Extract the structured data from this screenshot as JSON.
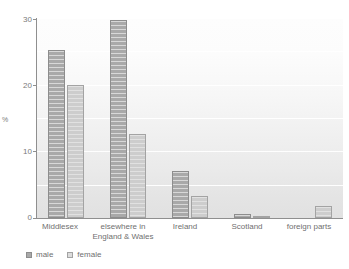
{
  "chart_data": {
    "type": "bar",
    "title": "",
    "subtitle": "",
    "xlabel": "",
    "ylabel": "%",
    "ylim": [
      0,
      30
    ],
    "yticks": [
      0,
      10,
      20,
      30
    ],
    "ytick_labels": [
      "0",
      "10",
      "20",
      "30"
    ],
    "gridlines": [
      0,
      5,
      10,
      15,
      20,
      25,
      30
    ],
    "grid": true,
    "legend_position": "bottom-left",
    "categories": [
      "Middlesex",
      "elsewhere in\nEngland & Wales",
      "Ireland",
      "Scotland",
      "foreign parts"
    ],
    "category_labels": [
      {
        "line1": "Middlesex",
        "line2": ""
      },
      {
        "line1": "elsewhere in",
        "line2": "England & Wales"
      },
      {
        "line1": "Ireland",
        "line2": ""
      },
      {
        "line1": "Scotland",
        "line2": ""
      },
      {
        "line1": "foreign parts",
        "line2": ""
      }
    ],
    "series": [
      {
        "name": "male",
        "color": "#a9a9a9",
        "values": [
          25.2,
          29.7,
          7.1,
          0.6,
          0
        ]
      },
      {
        "name": "female",
        "color": "#cdcdcd",
        "values": [
          19.9,
          12.6,
          3.3,
          0.2,
          1.8
        ]
      }
    ]
  },
  "legend": {
    "entries": [
      {
        "label": "male",
        "swatch": "male-swatch-icon"
      },
      {
        "label": "female",
        "swatch": "female-swatch-icon"
      }
    ]
  },
  "axes": {
    "y_title": "%",
    "y_tick_0": "0",
    "y_tick_1": "10",
    "y_tick_2": "20",
    "y_tick_3": "30"
  }
}
